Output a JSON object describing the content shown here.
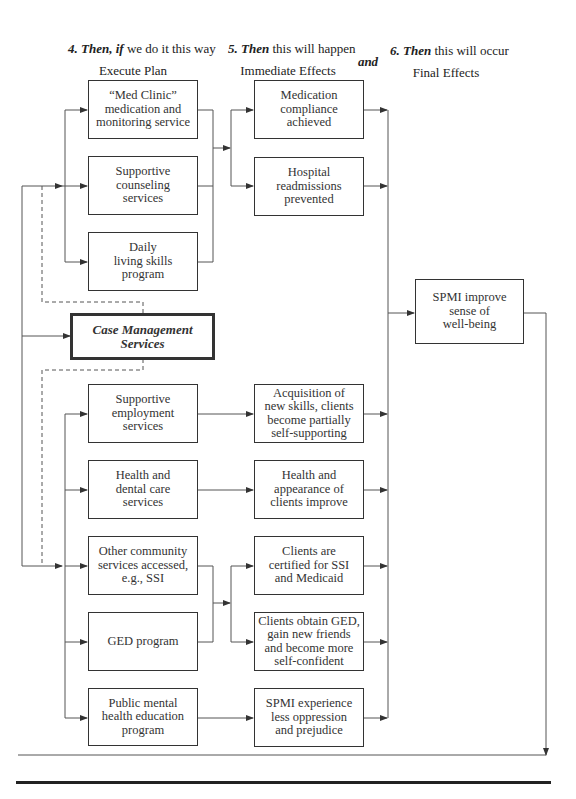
{
  "headers": {
    "col4": {
      "num": "4.",
      "emph": "Then, if",
      "rest": " we do it this way",
      "sub": "Execute Plan"
    },
    "col5": {
      "num": "5.",
      "emph": "Then",
      "rest": " this will happen",
      "sub": "Immediate Effects"
    },
    "connector": "and",
    "col6": {
      "num": "6.",
      "emph": "Then",
      "rest": " this will occur",
      "sub": "Final Effects"
    }
  },
  "execute_plan": [
    "“Med Clinic”\nmedication and\nmonitoring service",
    "Supportive\ncounseling\nservices",
    "Daily\nliving skills\nprogram",
    "Supportive\nemployment\nservices",
    "Health and\ndental care\nservices",
    "Other community\nservices accessed,\ne.g., SSI",
    "GED program",
    "Public mental\nhealth education\nprogram"
  ],
  "case_management": "Case Management\nServices",
  "immediate_effects": [
    "Medication\ncompliance\nachieved",
    "Hospital\nreadmissions\nprevented",
    "Acquisition of\nnew skills, clients\nbecome partially\nself-supporting",
    "Health and\nappearance of\nclients improve",
    "Clients are\ncertified for SSI\nand Medicaid",
    "Clients obtain GED,\ngain new friends\nand become more\nself-confident",
    "SPMI experience\nless oppression\nand prejudice"
  ],
  "final_effect": "SPMI improve\nsense of\nwell-being"
}
